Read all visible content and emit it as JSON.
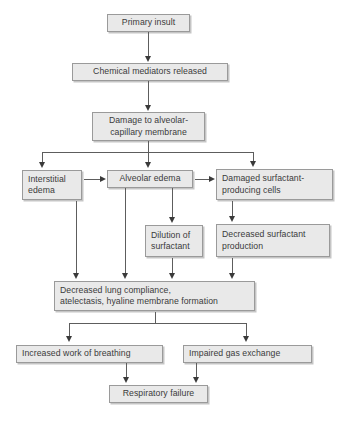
{
  "diagram": {
    "colors": {
      "box_fill": "#e9e9e9",
      "box_border": "#9a9a9a",
      "text": "#3b3b3b",
      "connector": "#5d5d5d",
      "background": "#ffffff"
    },
    "nodes": [
      {
        "id": "primary-insult",
        "label": "Primary insult"
      },
      {
        "id": "chemical-mediators",
        "label": "Chemical mediators released"
      },
      {
        "id": "damage-membrane",
        "label": "Damage to alveolar-\ncapillary membrane"
      },
      {
        "id": "interstitial-edema",
        "label": "Interstitial\nedema"
      },
      {
        "id": "alveolar-edema",
        "label": "Alveolar edema"
      },
      {
        "id": "damaged-surfactant-cells",
        "label": "Damaged surfactant-\nproducing cells"
      },
      {
        "id": "dilution-surfactant",
        "label": "Dilution of\nsurfactant"
      },
      {
        "id": "decreased-surfactant",
        "label": "Decreased surfactant\nproduction"
      },
      {
        "id": "decreased-compliance",
        "label": "Decreased lung compliance,\natelectasis, hyaline membrane formation"
      },
      {
        "id": "increased-work",
        "label": "Increased work of breathing"
      },
      {
        "id": "impaired-gas-exchange",
        "label": "Impaired gas exchange"
      },
      {
        "id": "respiratory-failure",
        "label": "Respiratory failure"
      }
    ]
  }
}
